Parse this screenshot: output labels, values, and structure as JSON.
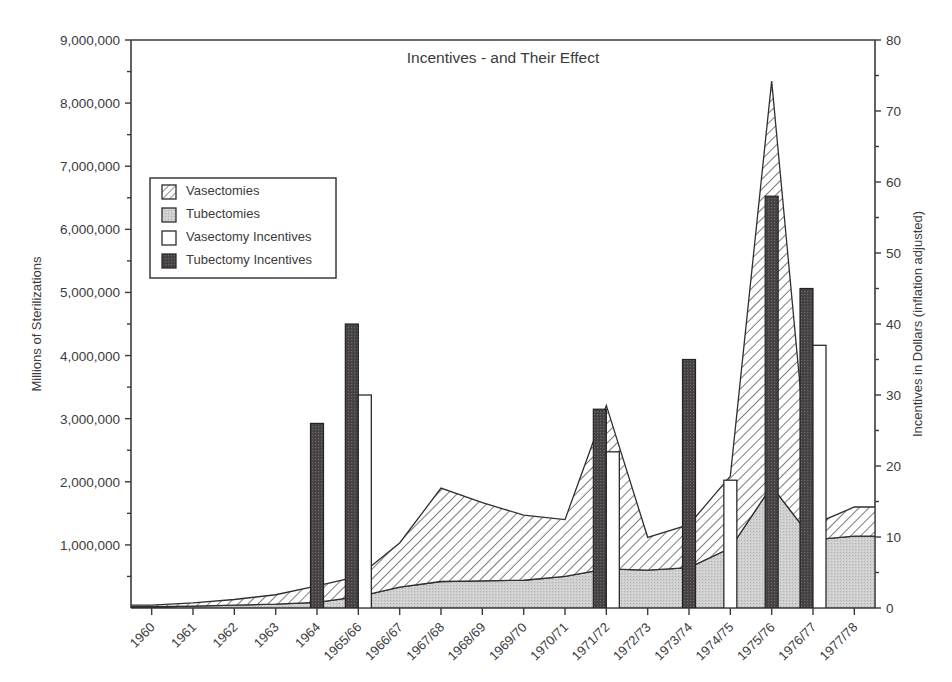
{
  "chart_data": {
    "type": "area",
    "title": "Incentives - and Their Effect",
    "xlabel": "",
    "ylabel": "Millions of Sterilizations",
    "y2label": "Incentives in Dollars (inflation adjusted)",
    "ylim": [
      0,
      9000000
    ],
    "y2lim": [
      0,
      80
    ],
    "grid": false,
    "legend_position": "upper-left-inside",
    "categories": [
      "1960",
      "1961",
      "1962",
      "1963",
      "1964",
      "1965/66",
      "1966/67",
      "1967/68",
      "1968/69",
      "1969/70",
      "1970/71",
      "1971/72",
      "1972/73",
      "1973/74",
      "1974/75",
      "1975/76",
      "1976/77",
      "1977/78"
    ],
    "ytick_labels": [
      "9,000,000",
      "8,000,000",
      "7,000,000",
      "6,000,000",
      "5,000,000",
      "4,000,000",
      "3,000,000",
      "2,000,000",
      "1,000,000"
    ],
    "ytick_values": [
      9000000,
      8000000,
      7000000,
      6000000,
      5000000,
      4000000,
      3000000,
      2000000,
      1000000
    ],
    "y2tick_labels": [
      "80",
      "70",
      "60",
      "50",
      "40",
      "30",
      "20",
      "10",
      "0"
    ],
    "y2tick_values": [
      80,
      70,
      60,
      50,
      40,
      30,
      20,
      10,
      0
    ],
    "series": [
      {
        "name": "Tubectomies",
        "axis": "left",
        "render": "stacked-area",
        "fill": "gray-dotted",
        "values": [
          20000,
          30000,
          45000,
          60000,
          90000,
          180000,
          330000,
          420000,
          430000,
          440000,
          500000,
          620000,
          600000,
          640000,
          950000,
          1930000,
          1080000,
          1140000
        ]
      },
      {
        "name": "Vasectomies",
        "axis": "left",
        "render": "stacked-area",
        "fill": "diagonal-hatch",
        "values": [
          25000,
          50000,
          90000,
          150000,
          260000,
          320000,
          700000,
          1480000,
          1240000,
          1030000,
          900000,
          2590000,
          520000,
          680000,
          1140000,
          6420000,
          240000,
          460000
        ]
      },
      {
        "name": "Tubectomy Incentives",
        "axis": "right",
        "render": "bar",
        "fill": "dark",
        "values": [
          0,
          0,
          0,
          0,
          26,
          40,
          0,
          0,
          0,
          0,
          0,
          28,
          0,
          35,
          0,
          58,
          45,
          0
        ]
      },
      {
        "name": "Vasectomy Incentives",
        "axis": "right",
        "render": "bar",
        "fill": "white",
        "values": [
          0,
          0,
          0,
          0,
          0,
          30,
          0,
          0,
          0,
          0,
          0,
          22,
          0,
          0,
          18,
          0,
          37,
          0
        ]
      }
    ]
  },
  "legend": {
    "items": [
      {
        "label": "Vasectomies",
        "swatch": "diagonal-hatch"
      },
      {
        "label": "Tubectomies",
        "swatch": "gray-dotted"
      },
      {
        "label": "Vasectomy Incentives",
        "swatch": "white"
      },
      {
        "label": "Tubectomy Incentives",
        "swatch": "dark"
      }
    ]
  },
  "colors": {
    "axis": "#3a3a3a",
    "text": "#3b3b3b",
    "tubectomy_area": "#cccccc",
    "vasectomy_area": "#ffffff",
    "tubectomy_incentive_bar": "#4a4648",
    "vasectomy_incentive_bar": "#ffffff"
  }
}
